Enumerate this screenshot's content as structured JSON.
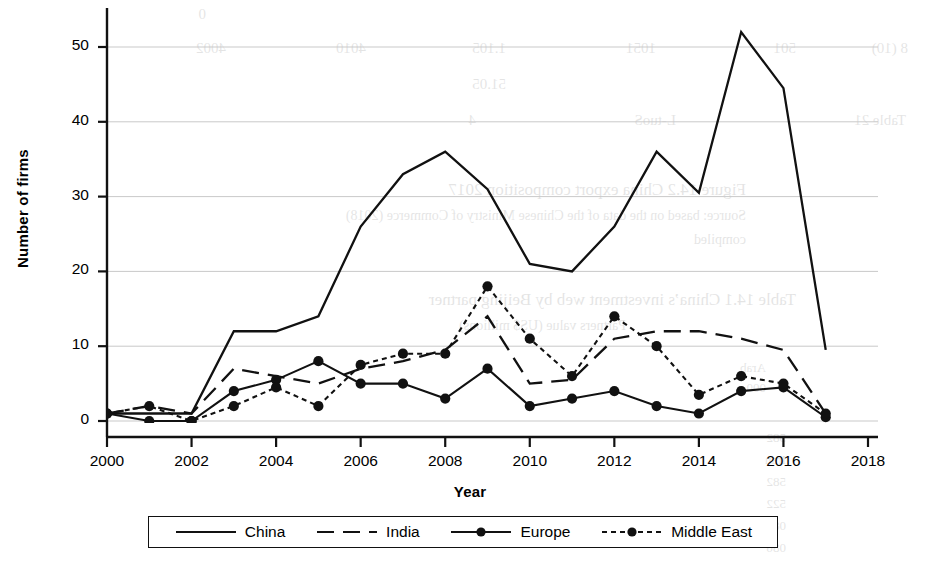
{
  "chart_data": {
    "type": "line",
    "title": "",
    "xlabel": "Year",
    "ylabel": "Number of firms",
    "x": [
      2000,
      2001,
      2002,
      2003,
      2004,
      2005,
      2006,
      2007,
      2008,
      2009,
      2010,
      2011,
      2012,
      2013,
      2014,
      2015,
      2016,
      2017
    ],
    "xlim": [
      2000,
      2018
    ],
    "ylim": [
      0,
      54
    ],
    "xticks": [
      2000,
      2002,
      2004,
      2006,
      2008,
      2010,
      2012,
      2014,
      2016,
      2018
    ],
    "yticks": [
      0,
      10,
      20,
      30,
      40,
      50
    ],
    "grid": "horizontal",
    "legend_position": "below-axes",
    "series": [
      {
        "name": "China",
        "linestyle": "solid",
        "marker": "none",
        "color": "#111111",
        "values": [
          1,
          1,
          1,
          12,
          12,
          14,
          26,
          33,
          36,
          31,
          21,
          20,
          26,
          36,
          30.5,
          52,
          44.5,
          9.5
        ]
      },
      {
        "name": "India",
        "linestyle": "long-dash",
        "marker": "none",
        "color": "#111111",
        "values": [
          1,
          2,
          1,
          7,
          6,
          5,
          7,
          8,
          9.5,
          14,
          5,
          5.5,
          11,
          12,
          12,
          11,
          9.5,
          1
        ]
      },
      {
        "name": "Europe",
        "linestyle": "solid",
        "marker": "circle",
        "color": "#111111",
        "values": [
          1,
          0,
          0,
          4,
          5.5,
          8,
          5,
          5,
          3,
          7,
          2,
          3,
          4,
          2,
          1,
          4,
          4.5,
          0.5
        ]
      },
      {
        "name": "Middle East",
        "linestyle": "dotted",
        "marker": "circle",
        "color": "#111111",
        "values": [
          1,
          2,
          0,
          2,
          4.5,
          2,
          7.5,
          9,
          9,
          18,
          11,
          6,
          14,
          10,
          3.5,
          6,
          5,
          1
        ]
      }
    ]
  },
  "legend": {
    "entries": [
      {
        "label": "China",
        "style": "solid",
        "marker": false
      },
      {
        "label": "India",
        "style": "long-dash",
        "marker": false
      },
      {
        "label": "Europe",
        "style": "solid",
        "marker": true
      },
      {
        "label": "Middle East",
        "style": "dotted",
        "marker": true
      }
    ]
  },
  "bleed_text": [
    {
      "text": "0",
      "x": 720,
      "y": 6,
      "size": 15
    },
    {
      "text": "8 (10)",
      "x": 18,
      "y": 40,
      "size": 15
    },
    {
      "text": "501",
      "x": 130,
      "y": 40,
      "size": 15
    },
    {
      "text": "1051",
      "x": 270,
      "y": 40,
      "size": 15
    },
    {
      "text": "1.105",
      "x": 420,
      "y": 40,
      "size": 15
    },
    {
      "text": "4010",
      "x": 560,
      "y": 40,
      "size": 15
    },
    {
      "text": "4002",
      "x": 700,
      "y": 40,
      "size": 15
    },
    {
      "text": "51.05",
      "x": 420,
      "y": 76,
      "size": 15
    },
    {
      "text": "Table 21",
      "x": 20,
      "y": 112,
      "size": 15
    },
    {
      "text": "L-tuoS",
      "x": 250,
      "y": 112,
      "size": 15
    },
    {
      "text": "4",
      "x": 450,
      "y": 112,
      "size": 15
    },
    {
      "text": "Figure 14.2  China export composition 2017",
      "x": 180,
      "y": 180,
      "size": 17
    },
    {
      "text": "Source: based on the data of the Chinese Ministry of Commerce (2018)",
      "x": 180,
      "y": 208,
      "size": 14
    },
    {
      "text": "compiled",
      "x": 180,
      "y": 232,
      "size": 14
    },
    {
      "text": "Table 14.1  China’s investment  web  by  Beijing partner",
      "x": 130,
      "y": 290,
      "size": 17
    },
    {
      "text": "Partners  value  (US$ millions)",
      "x": 300,
      "y": 318,
      "size": 14
    },
    {
      "text": "Arab",
      "x": 160,
      "y": 360,
      "size": 13
    },
    {
      "text": "000",
      "x": 160,
      "y": 380,
      "size": 13
    },
    {
      "text": "582",
      "x": 140,
      "y": 430,
      "size": 13
    },
    {
      "text": "Iran",
      "x": 140,
      "y": 452,
      "size": 13
    },
    {
      "text": "582",
      "x": 140,
      "y": 474,
      "size": 13
    },
    {
      "text": "522",
      "x": 140,
      "y": 496,
      "size": 13
    },
    {
      "text": "0891",
      "x": 140,
      "y": 518,
      "size": 13
    },
    {
      "text": "086",
      "x": 140,
      "y": 540,
      "size": 13
    }
  ]
}
